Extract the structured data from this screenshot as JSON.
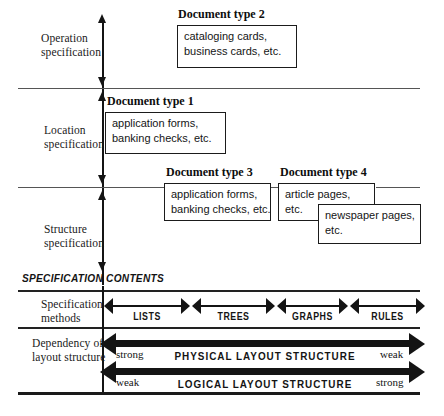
{
  "figure": {
    "axis_label": "specification-axis"
  },
  "bands": [
    {
      "id": "operation",
      "label_line1": "Operation",
      "label_line2": "specification"
    },
    {
      "id": "location",
      "label_line1": "Location",
      "label_line2": "specification"
    },
    {
      "id": "structure",
      "label_line1": "Structure",
      "label_line2": "specification"
    }
  ],
  "doc_boxes": [
    {
      "id": "type2",
      "title": "Document type 2",
      "line1": "cataloging cards,",
      "line2": "business cards, etc."
    },
    {
      "id": "type1",
      "title": "Document type 1",
      "line1": "application forms,",
      "line2": "banking checks, etc."
    },
    {
      "id": "type3",
      "title": "Document type 3",
      "line1": "application forms,",
      "line2": "banking checks, etc."
    },
    {
      "id": "type4",
      "title": "Document type 4",
      "line1": "article pages,",
      "line2": "etc."
    },
    {
      "id": "type4b",
      "title": "",
      "line1": "newspaper pages,",
      "line2": "etc."
    }
  ],
  "section_header": "SPECIFICATION  CONTENTS",
  "methods_row": {
    "label_line1": "Specification",
    "label_line2": "methods",
    "segments": [
      "LISTS",
      "TREES",
      "GRAPHS",
      "RULES"
    ]
  },
  "dependency_row": {
    "label_line1": "Dependency of",
    "label_line2": "layout structure",
    "arrows": [
      {
        "id": "physical",
        "name": "PHYSICAL  LAYOUT  STRUCTURE",
        "left_cap": "strong",
        "right_cap": "weak"
      },
      {
        "id": "logical",
        "name": "LOGICAL  LAYOUT  STRUCTURE",
        "left_cap": "weak",
        "right_cap": "strong"
      }
    ]
  },
  "colors": {
    "ink": "#141414",
    "rule": "#555555",
    "background": "#ffffff"
  }
}
